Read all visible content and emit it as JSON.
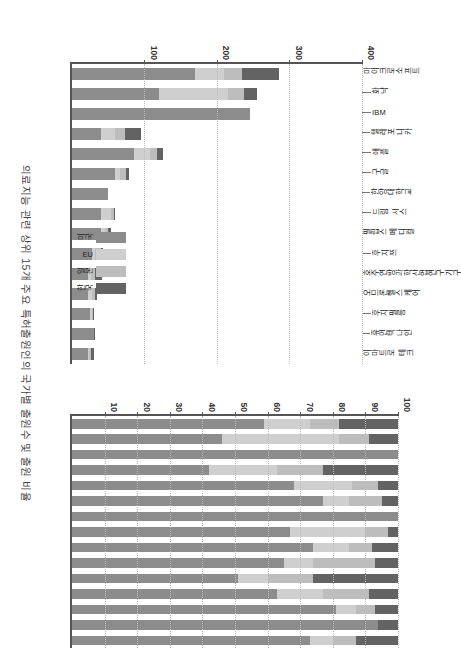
{
  "figure": {
    "title": "의료지능 관련 상위 15개 주요 특허출원인의 국가별 출원수 및 출원 비율"
  },
  "legend": {
    "items": [
      {
        "label": "미국",
        "color": "#8c8c8c"
      },
      {
        "label": "EU",
        "color": "#cfcfcf"
      },
      {
        "label": "일본",
        "color": "#bdbdbd"
      },
      {
        "label": "한국",
        "color": "#636363"
      }
    ]
  },
  "chart_data": [
    {
      "type": "bar",
      "id": "panel-a",
      "title": "국가별 출원수",
      "stacked": true,
      "xlabel": "",
      "ylabel": "",
      "ylim": [
        0,
        400
      ],
      "yticks": [
        100,
        200,
        300,
        400
      ],
      "grid": true,
      "legend_position": "inside-bottom-center",
      "categories": [
        "마이크로소프트",
        "화낙",
        "IBM",
        "텔레포니카",
        "애플",
        "구글",
        "한양대학교",
        "드림 시스",
        "필립스 메디컬",
        "후지쯔",
        "호주연방과학산업연구기구",
        "오므론헬스케어",
        "후지필름",
        "휴먼텍나인",
        "이마트로 테크"
      ],
      "series": [
        {
          "name": "미국",
          "values": [
            170,
            120,
            245,
            40,
            85,
            60,
            50,
            40,
            40,
            28,
            22,
            22,
            25,
            30,
            22
          ]
        },
        {
          "name": "EU",
          "values": [
            40,
            95,
            0,
            20,
            22,
            6,
            0,
            14,
            6,
            4,
            4,
            5,
            2,
            0,
            2
          ]
        },
        {
          "name": "일본",
          "values": [
            25,
            22,
            0,
            13,
            10,
            8,
            0,
            4,
            4,
            8,
            6,
            5,
            2,
            0,
            2
          ]
        },
        {
          "name": "한국",
          "values": [
            50,
            18,
            0,
            22,
            8,
            4,
            0,
            2,
            4,
            3,
            10,
            3,
            2,
            2,
            4
          ]
        }
      ]
    },
    {
      "type": "bar",
      "id": "panel-b",
      "title": "국가별 출원 비율",
      "stacked": true,
      "normalized": true,
      "xlabel": "",
      "ylabel": "",
      "ylim": [
        0,
        100
      ],
      "yticks": [
        10,
        20,
        30,
        40,
        50,
        60,
        70,
        80,
        90,
        100
      ],
      "grid": true,
      "categories": [
        "마이크로소프트",
        "화낙",
        "IBM",
        "텔레포니카",
        "애플",
        "구글",
        "한양대학교",
        "드림 시스",
        "필립스 메디컬",
        "후지쯔",
        "호주연방과학산업연구기구",
        "오므론헬스케어",
        "후지필름",
        "휴먼텍나인",
        "이마트로 테크"
      ],
      "series": [
        {
          "name": "미국",
          "values": [
            59,
            46,
            100,
            42,
            68,
            77,
            100,
            67,
            74,
            65,
            51,
            63,
            81,
            94,
            73
          ]
        },
        {
          "name": "EU",
          "values": [
            14,
            36,
            0,
            21,
            18,
            8,
            0,
            23,
            11,
            9,
            9,
            14,
            6,
            0,
            7
          ]
        },
        {
          "name": "일본",
          "values": [
            9,
            9,
            0,
            14,
            8,
            10,
            0,
            7,
            7,
            19,
            14,
            14,
            6,
            0,
            7
          ]
        },
        {
          "name": "한국",
          "values": [
            18,
            9,
            0,
            23,
            6,
            5,
            0,
            3,
            8,
            7,
            26,
            9,
            7,
            6,
            13
          ]
        }
      ]
    }
  ]
}
